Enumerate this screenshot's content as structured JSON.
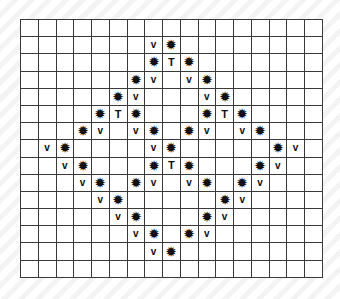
{
  "grid": {
    "rows": 15,
    "cols": 17,
    "legend": {
      "star": "✹",
      "v": "v",
      "T": "T"
    },
    "cells": [
      [
        "",
        "",
        "",
        "",
        "",
        "",
        "",
        "",
        "",
        "",
        "",
        "",
        "",
        "",
        "",
        "",
        ""
      ],
      [
        "",
        "",
        "",
        "",
        "",
        "",
        "",
        "v",
        "star",
        "",
        "",
        "",
        "",
        "",
        "",
        "",
        ""
      ],
      [
        "",
        "",
        "",
        "",
        "",
        "",
        "",
        "star",
        "T",
        "star",
        "",
        "",
        "",
        "",
        "",
        "",
        ""
      ],
      [
        "",
        "",
        "",
        "",
        "",
        "",
        "star",
        "v",
        "",
        "v",
        "star",
        "",
        "",
        "",
        "",
        "",
        ""
      ],
      [
        "",
        "",
        "",
        "",
        "",
        "star",
        "v",
        "",
        "",
        "",
        "v",
        "star",
        "",
        "",
        "",
        "",
        ""
      ],
      [
        "",
        "",
        "",
        "",
        "star",
        "T",
        "star",
        "",
        "",
        "",
        "star",
        "T",
        "star",
        "",
        "",
        "",
        ""
      ],
      [
        "",
        "",
        "",
        "star",
        "v",
        "",
        "v",
        "star",
        "",
        "star",
        "v",
        "",
        "v",
        "star",
        "",
        "",
        ""
      ],
      [
        "",
        "v",
        "star",
        "",
        "",
        "",
        "",
        "v",
        "star",
        "",
        "",
        "",
        "",
        "",
        "star",
        "v",
        ""
      ],
      [
        "",
        "",
        "v",
        "star",
        "",
        "",
        "",
        "star",
        "T",
        "star",
        "",
        "",
        "",
        "star",
        "v",
        "",
        ""
      ],
      [
        "",
        "",
        "",
        "v",
        "star",
        "",
        "star",
        "v",
        "",
        "v",
        "star",
        "",
        "star",
        "v",
        "",
        "",
        ""
      ],
      [
        "",
        "",
        "",
        "",
        "v",
        "star",
        "",
        "",
        "",
        "",
        "",
        "star",
        "v",
        "",
        "",
        "",
        ""
      ],
      [
        "",
        "",
        "",
        "",
        "",
        "v",
        "star",
        "",
        "",
        "",
        "star",
        "v",
        "",
        "",
        "",
        "",
        ""
      ],
      [
        "",
        "",
        "",
        "",
        "",
        "",
        "v",
        "star",
        "",
        "star",
        "v",
        "",
        "",
        "",
        "",
        "",
        ""
      ],
      [
        "",
        "",
        "",
        "",
        "",
        "",
        "",
        "v",
        "star",
        "",
        "",
        "",
        "",
        "",
        "",
        "",
        ""
      ],
      [
        "",
        "",
        "",
        "",
        "",
        "",
        "",
        "",
        "",
        "",
        "",
        "",
        "",
        "",
        "",
        "",
        ""
      ]
    ]
  }
}
